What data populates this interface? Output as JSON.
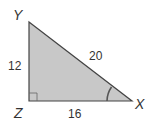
{
  "diagram": {
    "type": "right-triangle",
    "vertices": {
      "Y": {
        "label": "Y",
        "x": 29,
        "y": 22
      },
      "Z": {
        "label": "Z",
        "x": 29,
        "y": 101
      },
      "X": {
        "label": "X",
        "x": 132,
        "y": 101
      }
    },
    "sides": {
      "YZ": {
        "label": "12"
      },
      "ZX": {
        "label": "16"
      },
      "YX": {
        "label": "20"
      }
    },
    "right_angle_at": "Z",
    "marked_angle_at": "X",
    "colors": {
      "fill": "#c8c8c8",
      "stroke": "#444444",
      "text": "#333333"
    }
  }
}
